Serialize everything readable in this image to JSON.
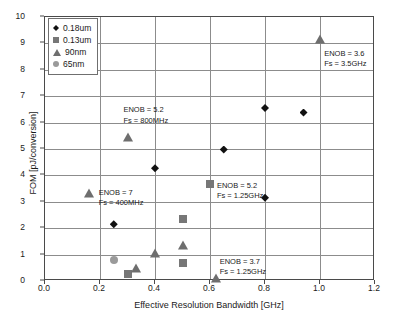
{
  "chart_data": {
    "type": "scatter",
    "title": "",
    "xlabel": "Effective Resolution Bandwidth [GHz]",
    "ylabel": "FOM [pJ/conversion]",
    "xlim": [
      0.0,
      1.2
    ],
    "ylim": [
      0,
      10
    ],
    "xticks": [
      "0.0",
      "0.2",
      "0.4",
      "0.6",
      "0.8",
      "1.0",
      "1.2"
    ],
    "yticks": [
      "0",
      "1",
      "2",
      "3",
      "4",
      "5",
      "6",
      "7",
      "8",
      "9",
      "10"
    ],
    "grid": true,
    "legend_position": "top-left",
    "series": [
      {
        "name": "0.18um",
        "marker": "diamond",
        "color": "#111111",
        "points": [
          {
            "x": 0.25,
            "y": 2.15
          },
          {
            "x": 0.4,
            "y": 4.27
          },
          {
            "x": 0.65,
            "y": 4.98
          },
          {
            "x": 0.8,
            "y": 6.55
          },
          {
            "x": 0.8,
            "y": 3.15
          },
          {
            "x": 0.94,
            "y": 6.38
          }
        ]
      },
      {
        "name": "0.13um",
        "marker": "square",
        "color": "#777777",
        "points": [
          {
            "x": 0.3,
            "y": 0.28
          },
          {
            "x": 0.5,
            "y": 2.35
          },
          {
            "x": 0.5,
            "y": 0.7
          },
          {
            "x": 0.6,
            "y": 3.67
          }
        ]
      },
      {
        "name": "90nm",
        "marker": "triangle",
        "color": "#6e6e6e",
        "points": [
          {
            "x": 0.16,
            "y": 3.35
          },
          {
            "x": 0.3,
            "y": 5.47
          },
          {
            "x": 0.33,
            "y": 0.5
          },
          {
            "x": 0.4,
            "y": 1.05
          },
          {
            "x": 0.5,
            "y": 1.38
          },
          {
            "x": 0.62,
            "y": 0.12
          },
          {
            "x": 1.0,
            "y": 9.15
          }
        ]
      },
      {
        "name": "65nm",
        "marker": "circle",
        "color": "#9a9a9a",
        "points": [
          {
            "x": 0.25,
            "y": 0.78
          }
        ]
      }
    ],
    "annotations": [
      {
        "line1": "ENOB = 5.2",
        "line2": "Fs = 800MHz",
        "x": 0.285,
        "y": 6.65
      },
      {
        "line1": "ENOB = 7",
        "line2": "Fs = 400MHz",
        "x": 0.195,
        "y": 3.52
      },
      {
        "line1": "ENOB = 5.2",
        "line2": "Fs = 1.25GHz",
        "x": 0.625,
        "y": 3.78
      },
      {
        "line1": "ENOB = 3.7",
        "line2": "Fs = 1.25GHz",
        "x": 0.635,
        "y": 0.9
      },
      {
        "line1": "ENOB = 3.6",
        "line2": "Fs = 3.5GHz",
        "x": 1.015,
        "y": 8.78
      }
    ]
  },
  "legend": {
    "items": [
      {
        "label": "0.18um",
        "marker": "diamond-marker-icon"
      },
      {
        "label": "0.13um",
        "marker": "square-marker-icon"
      },
      {
        "label": "90nm",
        "marker": "triangle-marker-icon"
      },
      {
        "label": "65nm",
        "marker": "circle-marker-icon"
      }
    ]
  }
}
